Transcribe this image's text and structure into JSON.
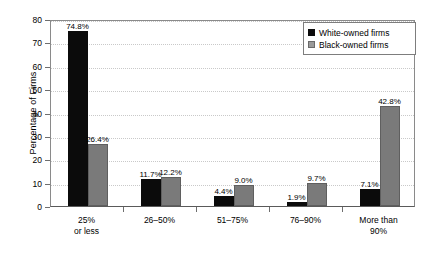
{
  "chart_data": {
    "type": "bar",
    "title": "",
    "xlabel": "",
    "ylabel": "Percentage of Firms",
    "ylim": [
      0,
      80
    ],
    "yticks": [
      0,
      10,
      20,
      30,
      40,
      50,
      60,
      70,
      80
    ],
    "grid": true,
    "legend_position": "top-right",
    "categories": [
      "25% or less",
      "26–50%",
      "51–75%",
      "76–90%",
      "More than 90%"
    ],
    "category_lines": [
      [
        "25%",
        "or less"
      ],
      [
        "26–50%",
        ""
      ],
      [
        "51–75%",
        ""
      ],
      [
        "76–90%",
        ""
      ],
      [
        "More than",
        "90%"
      ]
    ],
    "series": [
      {
        "name": "White-owned firms",
        "color": "#0b0b0b",
        "values": [
          74.8,
          11.7,
          4.4,
          1.9,
          7.1
        ],
        "labels": [
          "74.8%",
          "11.7%",
          "4.4%",
          "1.9%",
          "7.1%"
        ]
      },
      {
        "name": "Black-owned firms",
        "color": "#7a7a7a",
        "values": [
          26.4,
          12.2,
          9.0,
          9.7,
          42.8
        ],
        "labels": [
          "26.4%",
          "12.2%",
          "9.0%",
          "9.7%",
          "42.8%"
        ]
      }
    ]
  },
  "legend": {
    "entries": [
      {
        "label": "White-owned firms",
        "swatch": "black-swatch-icon"
      },
      {
        "label": "Black-owned firms",
        "swatch": "gray-swatch-icon"
      }
    ]
  },
  "axis": {
    "y_title": "Percentage of Firms",
    "y_tick_labels": [
      "0",
      "10",
      "20",
      "30",
      "40",
      "50",
      "60",
      "70",
      "80"
    ]
  }
}
